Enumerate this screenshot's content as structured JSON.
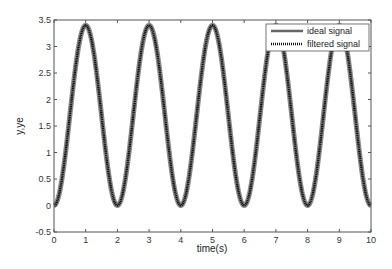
{
  "chart_data": {
    "type": "line",
    "title": "",
    "xlabel": "time(s)",
    "ylabel": "y,ye",
    "xlim": [
      0,
      10
    ],
    "ylim": [
      -0.5,
      3.5
    ],
    "xticks": [
      "0",
      "1",
      "2",
      "3",
      "4",
      "5",
      "6",
      "7",
      "8",
      "9",
      "10"
    ],
    "yticks": [
      "-0.5",
      "0",
      "0.5",
      "1",
      "1.5",
      "2",
      "2.5",
      "3",
      "3.5"
    ],
    "grid": false,
    "legend_position": "upper right",
    "series": [
      {
        "name": "ideal signal",
        "style": "solid",
        "color": "#888888",
        "formula": "1.7 - 1.7*cos(pi*t)",
        "amplitude": 1.7,
        "offset": 1.7,
        "period": 2,
        "x": [
          0,
          0.5,
          1,
          1.5,
          2,
          2.5,
          3,
          3.5,
          4,
          4.5,
          5,
          5.5,
          6,
          6.5,
          7,
          7.5,
          8,
          8.5,
          9,
          9.5,
          10
        ],
        "values": [
          0,
          1.7,
          3.4,
          1.7,
          0,
          1.7,
          3.4,
          1.7,
          0,
          1.7,
          3.4,
          1.7,
          0,
          1.7,
          3.4,
          1.7,
          0,
          1.7,
          3.4,
          1.7,
          0
        ]
      },
      {
        "name": "filtered signal",
        "style": "dotted",
        "color": "#111111",
        "x": [
          0,
          0.5,
          1,
          1.5,
          2,
          2.5,
          3,
          3.5,
          4,
          4.5,
          5,
          5.5,
          6,
          6.5,
          7,
          7.5,
          8,
          8.5,
          9,
          9.5,
          10
        ],
        "values": [
          0,
          1.7,
          3.4,
          1.7,
          0,
          1.7,
          3.4,
          1.7,
          0,
          1.7,
          3.4,
          1.7,
          0,
          1.7,
          3.4,
          1.7,
          0,
          1.7,
          3.4,
          1.7,
          0
        ]
      }
    ]
  },
  "legend": {
    "items": [
      {
        "label": "ideal signal"
      },
      {
        "label": "filtered signal"
      }
    ]
  },
  "axes": {
    "xlabel": "time(s)",
    "ylabel": "y,ye"
  }
}
